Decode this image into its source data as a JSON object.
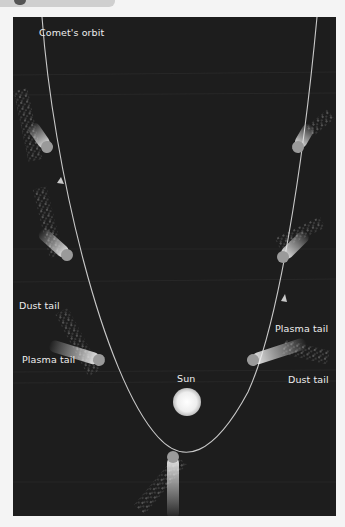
{
  "diagram": {
    "labels": {
      "orbit": "Comet's orbit",
      "sun": "Sun",
      "dust_tail_left": "Dust tail",
      "plasma_tail_left": "Plasma tail",
      "plasma_tail_right": "Plasma tail",
      "dust_tail_right": "Dust tail"
    },
    "colors": {
      "background": "#1d1d1d",
      "orbit_line": "#c9c9c9",
      "sun": "#f2f2f2",
      "comet_nucleus": "#9a9a9a",
      "tail": "#e8e8e8",
      "label_text": "#ededed",
      "page": "#f4f4f4"
    },
    "comets": [
      {
        "position": "upper-left",
        "direction": "incoming"
      },
      {
        "position": "mid-left",
        "direction": "incoming"
      },
      {
        "position": "lower-left",
        "direction": "incoming"
      },
      {
        "position": "perihelion",
        "direction": "around sun"
      },
      {
        "position": "lower-right",
        "direction": "outgoing"
      },
      {
        "position": "mid-right",
        "direction": "outgoing"
      },
      {
        "position": "upper-right",
        "direction": "outgoing"
      }
    ]
  }
}
